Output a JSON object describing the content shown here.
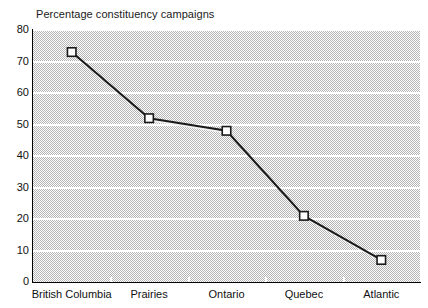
{
  "chart_data": {
    "type": "line",
    "title": "Percentage constituency campaigns",
    "xlabel": "",
    "ylabel": "",
    "categories": [
      "British Columbia",
      "Prairies",
      "Ontario",
      "Quebec",
      "Atlantic"
    ],
    "values": [
      73,
      52,
      48,
      21,
      7
    ],
    "series": [
      {
        "name": "Percentage constituency campaigns",
        "values": [
          73,
          52,
          48,
          21,
          7
        ]
      }
    ],
    "ylim": [
      0,
      80
    ],
    "ytick_labels": [
      "0",
      "10",
      "20",
      "30",
      "40",
      "50",
      "60",
      "70",
      "80"
    ],
    "ytick_values": [
      0,
      10,
      20,
      30,
      40,
      50,
      60,
      70,
      80
    ],
    "grid": "horizontal",
    "legend": "none",
    "marker": "open-square",
    "line_color": "#1a1a1a",
    "marker_fill": "#ffffff",
    "plot_background": "#b4b4b4",
    "gridline_color": "#ffffff"
  }
}
